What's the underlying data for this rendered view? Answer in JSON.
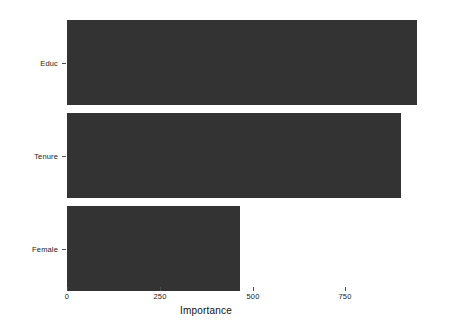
{
  "chart_data": {
    "type": "bar",
    "orientation": "horizontal",
    "title": "",
    "subtitle": "",
    "xlabel": "Importance",
    "ylabel": "",
    "categories": [
      "Educ",
      "Tenure",
      "Female"
    ],
    "values": [
      944,
      901,
      467
    ],
    "series": [
      {
        "name": "Importance",
        "values": [
          944,
          901,
          467
        ]
      }
    ],
    "xlim": [
      0,
      995
    ],
    "xticks": [
      0,
      250,
      500,
      750
    ],
    "xtick_labels": [
      "0",
      "250",
      "500",
      "750"
    ],
    "ytick_labels": [
      "Educ",
      "Tenure",
      "Female"
    ],
    "grid": false,
    "legend": false,
    "legend_position": "none",
    "bar_color": "#333333",
    "background_color": "#ffffff",
    "axis_text_color": "#1a1a1a",
    "annotations": []
  },
  "axis": {
    "x_title": "Importance",
    "x_tick_0": "0",
    "x_tick_1": "250",
    "x_tick_2": "500",
    "x_tick_3": "750"
  },
  "bars": [
    {
      "label": "Educ",
      "value": 944
    },
    {
      "label": "Tenure",
      "value": 901
    },
    {
      "label": "Female",
      "value": 467
    }
  ]
}
